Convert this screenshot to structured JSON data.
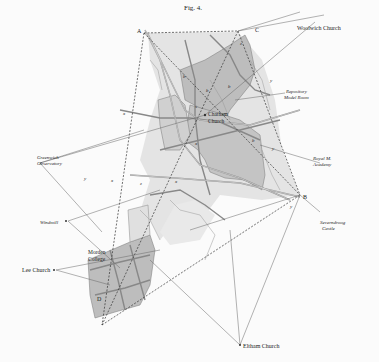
{
  "figure": {
    "title": "Fig. 4."
  },
  "stations": {
    "A": "A",
    "B": "B",
    "C": "C",
    "D": "D"
  },
  "places": {
    "chatham_church": "Chatham Church",
    "woolwich_church": "Woolwich Church",
    "repository_model_room": [
      "Repository",
      "Model Room"
    ],
    "royal_military_academy": [
      "Royal M.",
      "Academy"
    ],
    "greenwich_observatory": [
      "Greenwich",
      "Observatory"
    ],
    "shooters_castle": [
      "Severndroog",
      "Castle"
    ],
    "windmill": "Windmill",
    "lee_church": "Lee Church",
    "morden_college": [
      "Morden",
      "College"
    ],
    "eltham_church": "Eltham Church"
  },
  "point_marks": {
    "x": "x",
    "y": "y",
    "z": "z",
    "b": "b",
    "s": "s"
  },
  "colors": {
    "paper": "#fbfbfb",
    "ink": "#333333",
    "shade_dark": "#bdbdbd",
    "shade_light": "#dcdcdc",
    "road": "#8a8a8a"
  }
}
